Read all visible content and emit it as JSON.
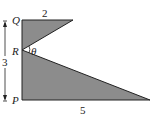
{
  "diagram": {
    "points": {
      "Q": {
        "label": "Q"
      },
      "R": {
        "label": "R"
      },
      "P": {
        "label": "P"
      }
    },
    "angle_label": "θ",
    "dimensions": {
      "top_width": "2",
      "height": "3",
      "bottom_width": "5"
    },
    "fill_color": "#8c8c8c",
    "stroke_color": "#222222"
  }
}
